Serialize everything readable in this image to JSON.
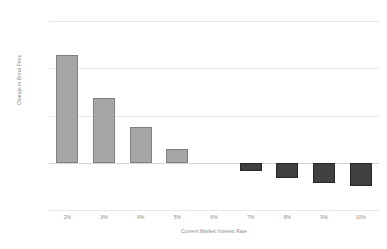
{
  "chart_data": {
    "type": "bar",
    "title": "",
    "xlabel": "Current Market Interest Rate",
    "ylabel": "Change in Bond Price",
    "categories": [
      "2%",
      "3%",
      "4%",
      "5%",
      "6%",
      "7%",
      "8%",
      "9%",
      "10%"
    ],
    "values": [
      228,
      138,
      75,
      30,
      0,
      -18,
      -32,
      -42,
      -50
    ],
    "value_labels": [
      "228%",
      "138%",
      "75%",
      "30%",
      "0%",
      "-18%",
      "-32%",
      "-42%",
      "-50%"
    ],
    "ylim": [
      -100,
      300
    ],
    "yticks": [
      300,
      200,
      100,
      0,
      -100
    ],
    "ytick_labels": [
      "300%",
      "200%",
      "100%",
      "0%",
      "-100%"
    ],
    "grid": true,
    "legend": "none",
    "series": [
      {
        "name": "Change in Bond Price",
        "values": [
          228,
          138,
          75,
          30,
          0,
          -18,
          -32,
          -42,
          -50
        ]
      }
    ],
    "colors": {
      "positive_bar_fill": "#a6a6a6",
      "positive_bar_stroke": "#7f7f7f",
      "negative_bar_fill": "#404040",
      "negative_bar_stroke": "#262626",
      "gridline": "#e9e9e9",
      "zero_line": "#d5d5d5",
      "tick_label": "#8b8b8b",
      "background": "#ffffff"
    }
  }
}
